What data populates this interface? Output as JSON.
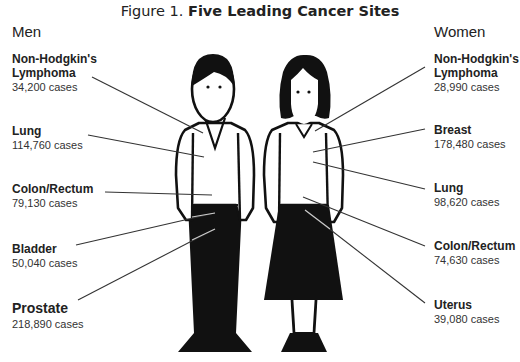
{
  "title": {
    "prefix": "Figure 1.",
    "main": "Five Leading Cancer Sites"
  },
  "men": {
    "heading": "Men",
    "sites": [
      {
        "line1": "Non-Hodgkin's",
        "line2": "Lymphoma",
        "cases": "34,200 cases"
      },
      {
        "line1": "Lung",
        "cases": "114,760 cases"
      },
      {
        "line1": "Colon/Rectum",
        "cases": "79,130 cases"
      },
      {
        "line1": "Bladder",
        "cases": "50,040 cases"
      },
      {
        "line1": "Prostate",
        "cases": "218,890 cases"
      }
    ]
  },
  "women": {
    "heading": "Women",
    "sites": [
      {
        "line1": "Non-Hodgkin's",
        "line2": "Lymphoma",
        "cases": "28,990 cases"
      },
      {
        "line1": "Breast",
        "cases": "178,480 cases"
      },
      {
        "line1": "Lung",
        "cases": "98,620 cases"
      },
      {
        "line1": "Colon/Rectum",
        "cases": "74,630 cases"
      },
      {
        "line1": "Uterus",
        "cases": "39,080 cases"
      }
    ]
  },
  "colors": {
    "ink": "#111111",
    "text": "#222222",
    "leader": "#333333"
  }
}
